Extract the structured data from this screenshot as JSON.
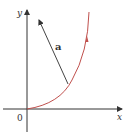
{
  "diagram": {
    "axes": {
      "x_label": "x",
      "y_label": "y",
      "origin_label": "0"
    },
    "vector": {
      "label": "a"
    },
    "colors": {
      "axis": "#333333",
      "curve": "#c0504d",
      "vector": "#444444"
    }
  }
}
